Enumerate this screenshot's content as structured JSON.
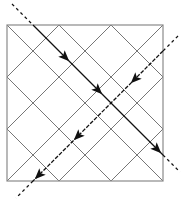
{
  "diagram": {
    "type": "diamond-lattice-with-trajectories",
    "frame": {
      "x": 7,
      "y": 25,
      "size": 156,
      "fill": "#d4d4d4",
      "stroke": "#8a8a8a"
    },
    "grid": {
      "cells_across": 3,
      "cell_half": 26,
      "tile_fill": "#ffffff",
      "line_color": "#6e6e6e"
    },
    "colors": {
      "background": "#ffffff",
      "frame_fill": "#d4d4d4",
      "frame_stroke": "#8a8a8a",
      "grid_line": "#6e6e6e",
      "path": "#111111"
    },
    "paths": [
      {
        "name": "path-descending-right",
        "direction": "down-right",
        "entry_dashed": [
          [
            12,
            4
          ],
          [
            33,
            25
          ]
        ],
        "solid": [
          [
            33,
            25
          ],
          [
            163,
            155
          ]
        ],
        "exit_dashed": [
          [
            163,
            155
          ],
          [
            180,
            172
          ]
        ],
        "arrows": [
          [
            65,
            57
          ],
          [
            98,
            90
          ],
          [
            157,
            149
          ]
        ]
      },
      {
        "name": "path-descending-left",
        "direction": "down-left",
        "entry_dashed": [
          [
            178,
            36
          ],
          [
            163,
            51
          ]
        ],
        "solid": [
          [
            163,
            51
          ],
          [
            33,
            181
          ]
        ],
        "exit_dashed": [
          [
            33,
            181
          ],
          [
            16,
            198
          ]
        ],
        "arrows": [
          [
            135,
            79
          ],
          [
            78,
            136
          ],
          [
            39,
            175
          ]
        ]
      }
    ]
  }
}
